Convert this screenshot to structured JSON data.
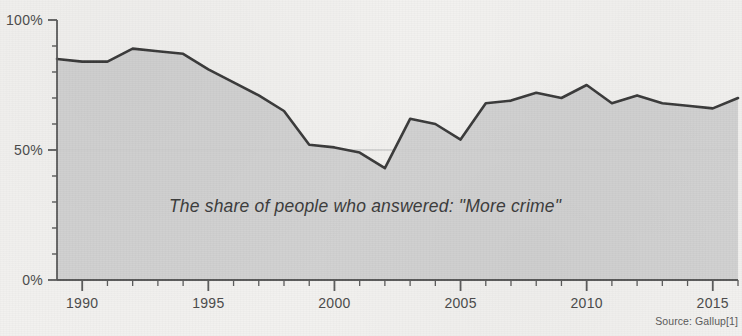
{
  "chart_data": {
    "type": "area",
    "title": "",
    "subtitle": "",
    "annotation": "The share of people who answered: \"More crime\"",
    "source": "Source: Gallup[1]",
    "xlabel": "",
    "ylabel": "",
    "xlim": [
      1989,
      2016
    ],
    "ylim": [
      0,
      100
    ],
    "grid": true,
    "gridlines_y": [
      50
    ],
    "legend": "none",
    "y_ticks_major": [
      0,
      50,
      100
    ],
    "y_tick_labels": [
      "0%",
      "50%",
      "100%"
    ],
    "y_ticks_minor": [
      10,
      20,
      30,
      40,
      60,
      70,
      80,
      90
    ],
    "x_ticks_major": [
      1990,
      1995,
      2000,
      2005,
      2010,
      2015
    ],
    "x_tick_labels": [
      "1990",
      "1995",
      "2000",
      "2005",
      "2010",
      "2015"
    ],
    "x_ticks_minor": [
      1991,
      1992,
      1993,
      1994,
      1996,
      1997,
      1998,
      1999,
      2001,
      2002,
      2003,
      2004,
      2006,
      2007,
      2008,
      2009,
      2011,
      2012,
      2013,
      2014,
      2016
    ],
    "x": [
      1989,
      1990,
      1991,
      1992,
      1993,
      1994,
      1995,
      1996,
      1997,
      1998,
      1999,
      2000,
      2001,
      2002,
      2003,
      2004,
      2005,
      2006,
      2007,
      2008,
      2009,
      2010,
      2011,
      2012,
      2013,
      2014,
      2015,
      2016
    ],
    "values": [
      85,
      84,
      84,
      89,
      88,
      87,
      81,
      76,
      71,
      65,
      52,
      51,
      49,
      43,
      62,
      60,
      54,
      68,
      69,
      72,
      70,
      75,
      68,
      71,
      68,
      67,
      66,
      70
    ],
    "series": [
      {
        "name": "More crime",
        "values": [
          85,
          84,
          84,
          89,
          88,
          87,
          81,
          76,
          71,
          65,
          52,
          51,
          49,
          43,
          62,
          60,
          54,
          68,
          69,
          72,
          70,
          75,
          68,
          71,
          68,
          67,
          66,
          70
        ]
      }
    ],
    "colors": {
      "line": "#3a3a3a",
      "fill": "#cfcfcf",
      "background": "#f2f1ef",
      "axis": "#555555",
      "gridline": "#b9b9b9",
      "text": "#4b4b4b"
    }
  }
}
